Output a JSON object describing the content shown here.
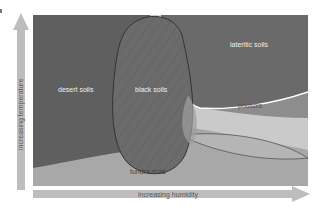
{
  "diagram": {
    "title": "",
    "y_axis": {
      "label": "increasing temperature",
      "direction": "up"
    },
    "x_axis": {
      "label": "increasing humidity",
      "direction": "right"
    },
    "regions": [
      {
        "id": "desert",
        "label": "desert soils",
        "color": "#5f5f5f"
      },
      {
        "id": "black",
        "label": "black soils",
        "color": "#6b6b6b",
        "pattern": "hatched"
      },
      {
        "id": "lateritic",
        "label": "lateritic soils",
        "color": "#6a6a6a"
      },
      {
        "id": "podsols",
        "label": "podsols",
        "color": "#c9c9c9"
      },
      {
        "id": "tundra",
        "label": "tundra soils",
        "color": "#a8a8a8"
      }
    ],
    "colors": {
      "background": "#ffffff",
      "arrow": "#bdbdbd",
      "boundary_dark": "#3a3a3a",
      "boundary_light": "#ffffff"
    }
  }
}
